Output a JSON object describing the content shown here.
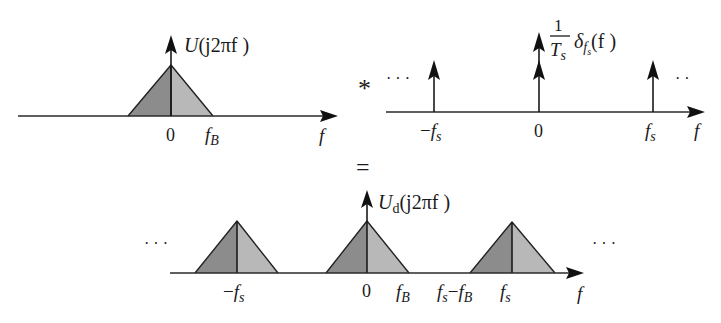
{
  "colors": {
    "triangle_left_fill": "#8c8c8c",
    "triangle_right_fill": "#b8b8b8",
    "stroke": "#222222",
    "background": "#ffffff"
  },
  "operators": {
    "convolution": "*",
    "equals": "="
  },
  "top_left_panel": {
    "title_prefix": "U",
    "title_args": "(j2πf )",
    "axis_label": "f",
    "ticks": [
      {
        "label": "0"
      },
      {
        "label_main": "f",
        "label_sub": "B"
      }
    ]
  },
  "top_right_panel": {
    "title_coef_num": "1",
    "title_coef_den_main": "T",
    "title_coef_den_sub": "s",
    "title_delta": "δ",
    "title_delta_sub_main": "f",
    "title_delta_sub_sub": "s",
    "title_args": "(f )",
    "axis_label": "f",
    "ellipsis_left": "· · ·",
    "ellipsis_right": "· ·",
    "ticks": [
      {
        "prefix": "−",
        "label_main": "f",
        "label_sub": "s"
      },
      {
        "label": "0"
      },
      {
        "label_main": "f",
        "label_sub": "s"
      }
    ]
  },
  "bottom_panel": {
    "title_main": "U",
    "title_sub": "d",
    "title_args": "(j2πf )",
    "axis_label": "f",
    "ellipsis_left": "· · ·",
    "ellipsis_right": "· · ·",
    "ticks": [
      {
        "prefix": "−",
        "label_main": "f",
        "label_sub": "s"
      },
      {
        "label": "0"
      },
      {
        "label_main": "f",
        "label_sub": "B"
      },
      {
        "label_main": "f",
        "label_sub": "s",
        "mid": "−",
        "label_main2": "f",
        "label_sub2": "B"
      },
      {
        "label_main": "f",
        "label_sub": "s"
      }
    ]
  }
}
